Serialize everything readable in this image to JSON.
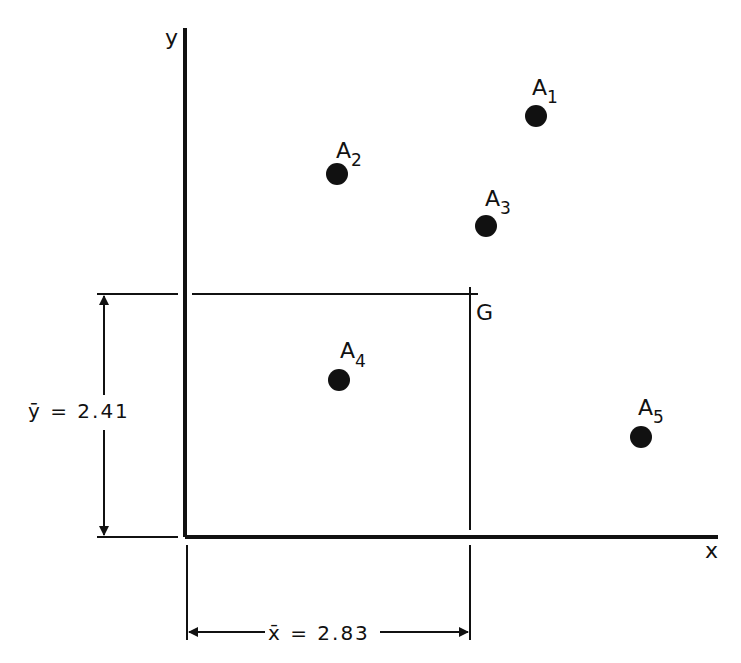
{
  "diagram": {
    "axes": {
      "x_label": "x",
      "y_label": "y"
    },
    "centroid": {
      "label": "G",
      "x_bar_symbol": "x̄",
      "y_bar_symbol": "ȳ",
      "x_bar_text": "x̄ = 2.83",
      "y_bar_text": "ȳ = 2.41",
      "x_bar_value": 2.83,
      "y_bar_value": 2.41
    },
    "points": [
      {
        "label": "A",
        "sub": "1",
        "name": "A1"
      },
      {
        "label": "A",
        "sub": "2",
        "name": "A2"
      },
      {
        "label": "A",
        "sub": "3",
        "name": "A3"
      },
      {
        "label": "A",
        "sub": "4",
        "name": "A4"
      },
      {
        "label": "A",
        "sub": "5",
        "name": "A5"
      }
    ],
    "colors": {
      "ink": "#111111",
      "background": "#ffffff"
    }
  }
}
